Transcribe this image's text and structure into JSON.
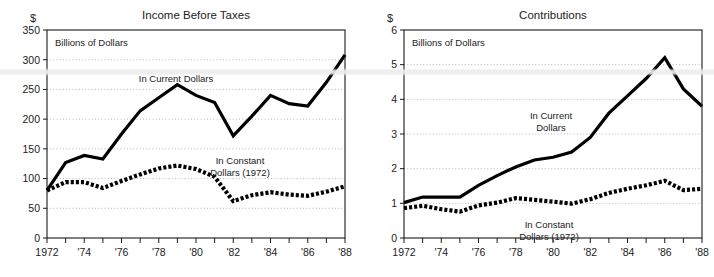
{
  "figure": {
    "name": "two-panel-line-chart",
    "background": "#ffffff",
    "line_color": "#000000",
    "grid_color": "#9a9a9a"
  },
  "panels": [
    {
      "id": "income-before-taxes",
      "title": "Income Before Taxes",
      "currency_symbol": "$",
      "units_note": "Billions of Dollars",
      "annotations": [
        {
          "id": "current-dollars",
          "lines": [
            "In Current Dollars"
          ]
        },
        {
          "id": "constant-dollars",
          "lines": [
            "In Constant",
            "Dollars (1972)"
          ]
        }
      ],
      "y_ticks": [
        "0",
        "50",
        "100",
        "150",
        "200",
        "250",
        "300",
        "350"
      ],
      "x_ticks": [
        "1972",
        "'74",
        "'76",
        "'78",
        "'80",
        "'82",
        "'84",
        "'86",
        "'88"
      ]
    },
    {
      "id": "contributions",
      "title": "Contributions",
      "currency_symbol": "$",
      "units_note": "Billions of Dollars",
      "annotations": [
        {
          "id": "current-dollars",
          "lines": [
            "In Current",
            "Dollars"
          ]
        },
        {
          "id": "constant-dollars",
          "lines": [
            "In Constant",
            "Dollars (1972)"
          ]
        }
      ],
      "y_ticks": [
        "0",
        "1",
        "2",
        "3",
        "4",
        "5",
        "6"
      ],
      "x_ticks": [
        "1972",
        "'74",
        "'76",
        "'78",
        "'80",
        "'82",
        "'84",
        "'86",
        "'88"
      ]
    }
  ],
  "chart_data": [
    {
      "type": "line",
      "id": "income-before-taxes",
      "title": "Income Before Taxes",
      "xlabel": "",
      "ylabel": "Billions of Dollars",
      "xlim": [
        1972,
        1988
      ],
      "ylim": [
        0,
        350
      ],
      "ytick_values": [
        0,
        50,
        100,
        150,
        200,
        250,
        300,
        350
      ],
      "xtick_values": [
        1972,
        1973,
        1974,
        1975,
        1976,
        1977,
        1978,
        1979,
        1980,
        1981,
        1982,
        1983,
        1984,
        1985,
        1986,
        1987,
        1988
      ],
      "xtick_labels": [
        "1972",
        "",
        "'74",
        "",
        "'76",
        "",
        "'78",
        "",
        "'80",
        "",
        "'82",
        "",
        "'84",
        "",
        "'86",
        "",
        "'88"
      ],
      "grid": true,
      "grid_axis": "y",
      "legend": "inline-annotation",
      "x": [
        1972,
        1973,
        1974,
        1975,
        1976,
        1977,
        1978,
        1979,
        1980,
        1981,
        1982,
        1983,
        1984,
        1985,
        1986,
        1987,
        1988
      ],
      "series": [
        {
          "name": "In Current Dollars",
          "style": "solid",
          "values": [
            80,
            127,
            139,
            133,
            175,
            214,
            236,
            258,
            240,
            228,
            172,
            205,
            240,
            226,
            222,
            262,
            308
          ]
        },
        {
          "name": "In Constant Dollars (1972)",
          "style": "dotted",
          "values": [
            80,
            94,
            94,
            84,
            96,
            107,
            117,
            122,
            116,
            103,
            62,
            72,
            77,
            73,
            71,
            78,
            87
          ]
        }
      ]
    },
    {
      "type": "line",
      "id": "contributions",
      "title": "Contributions",
      "xlabel": "",
      "ylabel": "Billions of Dollars",
      "xlim": [
        1972,
        1988
      ],
      "ylim": [
        0,
        6
      ],
      "ytick_values": [
        0,
        1,
        2,
        3,
        4,
        5,
        6
      ],
      "xtick_values": [
        1972,
        1973,
        1974,
        1975,
        1976,
        1977,
        1978,
        1979,
        1980,
        1981,
        1982,
        1983,
        1984,
        1985,
        1986,
        1987,
        1988
      ],
      "xtick_labels": [
        "1972",
        "",
        "'74",
        "",
        "'76",
        "",
        "'78",
        "",
        "'80",
        "",
        "'82",
        "",
        "'84",
        "",
        "'86",
        "",
        "'88"
      ],
      "grid": true,
      "grid_axis": "y",
      "legend": "inline-annotation",
      "x": [
        1972,
        1973,
        1974,
        1975,
        1976,
        1977,
        1978,
        1979,
        1980,
        1981,
        1982,
        1983,
        1984,
        1985,
        1986,
        1987,
        1988
      ],
      "series": [
        {
          "name": "In Current Dollars",
          "style": "solid",
          "values": [
            1.02,
            1.18,
            1.18,
            1.18,
            1.52,
            1.8,
            2.05,
            2.25,
            2.33,
            2.48,
            2.9,
            3.6,
            4.1,
            4.6,
            5.2,
            4.3,
            3.8
          ]
        },
        {
          "name": "In Constant Dollars (1972)",
          "style": "dotted",
          "values": [
            0.86,
            0.93,
            0.83,
            0.76,
            0.94,
            1.02,
            1.15,
            1.1,
            1.05,
            0.99,
            1.12,
            1.3,
            1.42,
            1.52,
            1.65,
            1.38,
            1.42
          ]
        }
      ]
    }
  ]
}
